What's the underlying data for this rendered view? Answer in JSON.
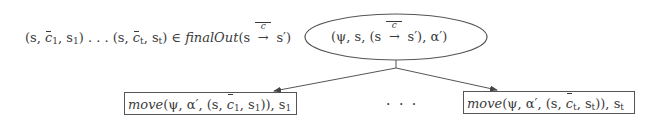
{
  "diagram": {
    "condition": {
      "prefix": "(s, ",
      "c1": "c",
      "c1_sub": "1",
      "mid1": ", s",
      "s1_sub": "1",
      "mid2": ") . . . (s, ",
      "ct": "c",
      "ct_sub": "t",
      "mid3": ", s",
      "st_sub": "t",
      "mid4": ") ∈ ",
      "func": "finalOut",
      "args_open": "(s ",
      "arrow_label": "c",
      "arrow": "→",
      "args_close": " s′)"
    },
    "root": {
      "shape": "ellipse",
      "open": "(ψ, s, (s ",
      "arrow_label": "c",
      "arrow": "→",
      "close": " s′), α′)"
    },
    "children": [
      {
        "shape": "box",
        "func": "move",
        "open": "(ψ, α′, (s, ",
        "c": "c",
        "c_sub": "1",
        "mid": ", s",
        "s_sub": "1",
        "close": ")), s",
        "tail_sub": "1"
      },
      {
        "shape": "box",
        "func": "move",
        "open": "(ψ, α′, (s, ",
        "c": "c",
        "c_sub": "t",
        "mid": ", s",
        "s_sub": "t",
        "close": ")), s",
        "tail_sub": "t"
      }
    ],
    "ellipsis": "· · ·",
    "colors": {
      "stroke": "#555555",
      "text": "#3a3a3a"
    }
  }
}
